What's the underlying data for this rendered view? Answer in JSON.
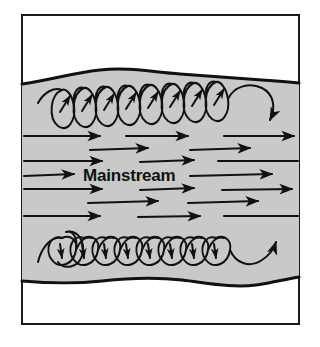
{
  "figure": {
    "caption_label": "Mainstream",
    "frame": {
      "x": 21,
      "y": 14,
      "width": 279,
      "height": 311,
      "stroke_color": "#1a1a1a",
      "stroke_width": 2,
      "fill_color": "#ffffff"
    },
    "flow_band": {
      "name": "turbulent-flow-band",
      "fill_color": "#c9c9c9",
      "edge_color": "#111111",
      "edge_width": 3,
      "top_wave_y": 84,
      "bottom_wave_y": 276
    },
    "vortex_rows": [
      {
        "name": "top-vortex-row",
        "count": 8,
        "direction": "counterclockwise",
        "arrow_direction": "up-right",
        "end_arrow": "down",
        "center_y": 106,
        "loop_width": 22,
        "loop_height": 42,
        "start_x": 52,
        "stroke_color": "#111111"
      },
      {
        "name": "bottom-vortex-row",
        "count": 8,
        "direction": "clockwise",
        "arrow_direction": "down",
        "end_arrow": "up-right",
        "center_y": 248,
        "loop_width": 22,
        "loop_height": 42,
        "start_x": 52,
        "stroke_color": "#111111"
      }
    ],
    "mainstream_rows": [
      {
        "y": 136,
        "segments": [
          {
            "x1": 24,
            "x2": 104,
            "head": true
          },
          {
            "x1": 126,
            "x2": 192,
            "head": true
          },
          {
            "x1": 224,
            "x2": 298,
            "head": true
          }
        ]
      },
      {
        "y": 149,
        "segments": [
          {
            "x1": 90,
            "x2": 150,
            "head": true
          },
          {
            "x1": 190,
            "x2": 252,
            "head": true
          }
        ]
      },
      {
        "y": 161,
        "segments": [
          {
            "x1": 24,
            "x2": 106,
            "head": true
          },
          {
            "x1": 140,
            "x2": 196,
            "head": true
          },
          {
            "x1": 218,
            "x2": 298,
            "head": false
          }
        ]
      },
      {
        "y": 175,
        "segments": [
          {
            "x1": 24,
            "x2": 78,
            "head": true
          },
          {
            "x1": 190,
            "x2": 276,
            "head": true
          }
        ]
      },
      {
        "y": 189,
        "segments": [
          {
            "x1": 24,
            "x2": 106,
            "head": true
          },
          {
            "x1": 140,
            "x2": 196,
            "head": true
          },
          {
            "x1": 222,
            "x2": 296,
            "head": true
          }
        ]
      },
      {
        "y": 202,
        "segments": [
          {
            "x1": 88,
            "x2": 160,
            "head": true
          },
          {
            "x1": 188,
            "x2": 262,
            "head": true
          }
        ]
      },
      {
        "y": 216,
        "segments": [
          {
            "x1": 24,
            "x2": 104,
            "head": true
          },
          {
            "x1": 138,
            "x2": 204,
            "head": true
          },
          {
            "x1": 224,
            "x2": 298,
            "head": false
          }
        ]
      }
    ],
    "mainstream_label": {
      "text": "Mainstream",
      "x": 83,
      "y": 181,
      "color": "#111111"
    },
    "colors": {
      "ink": "#111111",
      "band_gray": "#c9c9c9",
      "paper": "#ffffff"
    }
  }
}
